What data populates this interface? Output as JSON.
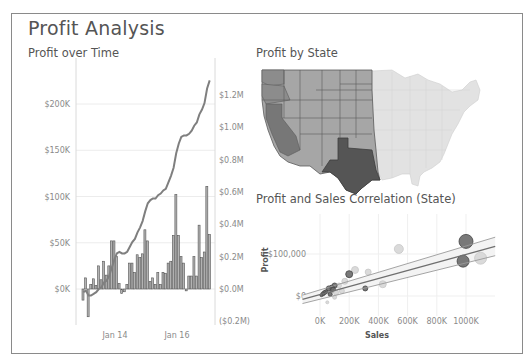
{
  "dashboard": {
    "title": "Profit Analysis"
  },
  "colors": {
    "bar_fill": "#b3b3b3",
    "bar_stroke": "#555555",
    "line": "#7f7f7f",
    "state_west_dark": "#555555",
    "state_west_mid": "#8c8c8c",
    "state_west_light": "#a6a6a6",
    "state_east": "#e2e2e2",
    "state_border": "#5a5a5a",
    "frame": "#8a8a8a",
    "text": "#555555"
  },
  "chart_data": [
    {
      "type": "bar",
      "title": "Profit over Time",
      "subtitle": "Profit (bars, left axis) with running total (line, right axis)",
      "xlabel": "",
      "ylabel": "",
      "x_ticks": [
        "Jan 14",
        "Jan 16"
      ],
      "y_left_ticks": [
        "$200K",
        "$150K",
        "$100K",
        "$50K",
        "$0K"
      ],
      "y_left_range": [
        -45000,
        225000
      ],
      "y_right_ticks": [
        "$1.2M",
        "$1.0M",
        "$0.8M",
        "$0.6M",
        "$0.4M",
        "$0.2M",
        "$0.0M",
        "($0.2M)"
      ],
      "y_right_range": [
        -0.25,
        1.35
      ],
      "grid": true,
      "series": [
        {
          "name": "Monthly Profit",
          "kind": "bar",
          "axis": "left",
          "values": [
            -12000,
            12000,
            -30000,
            5000,
            11000,
            4000,
            25000,
            10000,
            30000,
            15000,
            25000,
            52000,
            52000,
            35000,
            6000,
            -5000,
            -3000,
            5000,
            28000,
            28000,
            18000,
            37000,
            34000,
            38000,
            64000,
            52000,
            8000,
            12000,
            5000,
            18000,
            5000,
            18000,
            17000,
            28000,
            30000,
            58000,
            102000,
            58000,
            35000,
            28000,
            -2000,
            14000,
            14000,
            35000,
            14000,
            69000,
            34000,
            40000,
            111000,
            59000
          ]
        },
        {
          "name": "Running Total Profit",
          "kind": "line",
          "axis": "right",
          "values": [
            -0.02,
            -0.01,
            -0.04,
            -0.04,
            -0.03,
            -0.02,
            0.0,
            0.01,
            0.04,
            0.05,
            0.08,
            0.13,
            0.18,
            0.22,
            0.23,
            0.22,
            0.22,
            0.23,
            0.26,
            0.29,
            0.31,
            0.35,
            0.38,
            0.42,
            0.48,
            0.53,
            0.55,
            0.56,
            0.56,
            0.58,
            0.59,
            0.61,
            0.62,
            0.66,
            0.7,
            0.75,
            0.84,
            0.9,
            0.94,
            0.95,
            0.95,
            0.96,
            0.98,
            1.01,
            1.03,
            1.08,
            1.11,
            1.15,
            1.24,
            1.29
          ]
        }
      ]
    },
    {
      "type": "heatmap",
      "title": "Profit by State",
      "subtitle": "Choropleth map of US states shaded by profit (western states highlighted, Texas darkest)",
      "regions": [
        {
          "name": "Texas",
          "shade": "darkest"
        },
        {
          "name": "California",
          "shade": "dark"
        },
        {
          "name": "Washington",
          "shade": "dark"
        },
        {
          "name": "Oregon",
          "shade": "medium-dark"
        },
        {
          "name": "Western/Central states",
          "shade": "medium"
        },
        {
          "name": "Eastern states",
          "shade": "light (unhighlighted)"
        }
      ]
    },
    {
      "type": "scatter",
      "title": "Profit and Sales Correlation (State)",
      "xlabel": "Sales",
      "ylabel": "Profit",
      "x_ticks": [
        "0K",
        "200K",
        "400K",
        "600K",
        "800K",
        "1000K"
      ],
      "y_ticks": [
        "$100,000",
        "$0"
      ],
      "x_range": [
        -120000,
        1200000
      ],
      "y_range": [
        -30000,
        140000
      ],
      "grid": true,
      "points": [
        {
          "x": 1000000,
          "y": 130000,
          "size": 7,
          "shade": "dark"
        },
        {
          "x": 980000,
          "y": 83000,
          "size": 6,
          "shade": "dark"
        },
        {
          "x": 1100000,
          "y": 90000,
          "size": 6,
          "shade": "light"
        },
        {
          "x": 540000,
          "y": 112000,
          "size": 4.5,
          "shade": "light"
        },
        {
          "x": 430000,
          "y": 28000,
          "size": 3.5,
          "shade": "light"
        },
        {
          "x": 310000,
          "y": 18000,
          "size": 2.5,
          "shade": "dark"
        },
        {
          "x": 330000,
          "y": 57000,
          "size": 3,
          "shade": "light"
        },
        {
          "x": 240000,
          "y": 62000,
          "size": 3.5,
          "shade": "light"
        },
        {
          "x": 200000,
          "y": 52000,
          "size": 3.5,
          "shade": "dark"
        },
        {
          "x": 170000,
          "y": 35000,
          "size": 3,
          "shade": "light"
        },
        {
          "x": 130000,
          "y": 25000,
          "size": 2.5,
          "shade": "light"
        },
        {
          "x": 100000,
          "y": 25000,
          "size": 2.5,
          "shade": "dark"
        },
        {
          "x": 80000,
          "y": 20000,
          "size": 2.5,
          "shade": "dark"
        },
        {
          "x": 60000,
          "y": 18000,
          "size": 2.5,
          "shade": "dark"
        },
        {
          "x": 90000,
          "y": 15000,
          "size": 2.5,
          "shade": "dark"
        },
        {
          "x": 40000,
          "y": 10000,
          "size": 2,
          "shade": "dark"
        },
        {
          "x": 30000,
          "y": 8000,
          "size": 2,
          "shade": "dark"
        },
        {
          "x": 20000,
          "y": 5000,
          "size": 2,
          "shade": "dark"
        },
        {
          "x": 110000,
          "y": 8000,
          "size": 2.5,
          "shade": "light"
        },
        {
          "x": 70000,
          "y": 4000,
          "size": 2,
          "shade": "dark"
        },
        {
          "x": 150000,
          "y": 12000,
          "size": 2.5,
          "shade": "light"
        },
        {
          "x": 50000,
          "y": -15000,
          "size": 1.5,
          "shade": "light"
        },
        {
          "x": 100000,
          "y": -3000,
          "size": 2,
          "shade": "light"
        },
        {
          "x": 10000,
          "y": 2000,
          "size": 1.5,
          "shade": "dark"
        }
      ],
      "trend_lines": [
        {
          "name": "upper bound",
          "x": [
            -120000,
            1200000
          ],
          "y": [
            2000,
            140000
          ]
        },
        {
          "name": "trend",
          "x": [
            -120000,
            1200000
          ],
          "y": [
            -8000,
            118000
          ]
        },
        {
          "name": "lower bound",
          "x": [
            -120000,
            1200000
          ],
          "y": [
            -18000,
            96000
          ]
        }
      ]
    }
  ],
  "panels": {
    "profit_over_time": {
      "title": "Profit over Time"
    },
    "profit_by_state": {
      "title": "Profit by State"
    },
    "correlation": {
      "title": "Profit and Sales Correlation (State)",
      "xlabel": "Sales",
      "ylabel": "Profit"
    }
  }
}
